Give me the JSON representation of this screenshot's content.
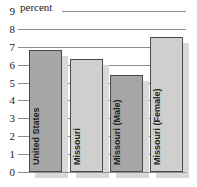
{
  "chart_data": {
    "type": "bar",
    "title": "",
    "subtitle": "",
    "caption": "percent",
    "xlabel": "",
    "ylabel": "percent",
    "ylim": [
      0,
      9
    ],
    "grid": true,
    "legend": "none",
    "categories": [
      "United States",
      "Missouri",
      "Missouri (Male)",
      "Missouri (Female)"
    ],
    "values": [
      6.8,
      6.3,
      5.4,
      7.55
    ],
    "yticks": [
      "0",
      "1",
      "2",
      "3",
      "4",
      "5",
      "6",
      "7",
      "8",
      "9"
    ],
    "bar_styles": [
      "dark",
      "light",
      "dark",
      "light"
    ],
    "colors": {
      "bar_dark": "#a6a6a6",
      "bar_light": "#cfcfcf",
      "bar_border": "#4a4a4a",
      "bar_shadow": "#d8d8d8",
      "gridline": "#8d8d8d",
      "text": "#1a1a1a",
      "background": "#ffffff"
    }
  }
}
